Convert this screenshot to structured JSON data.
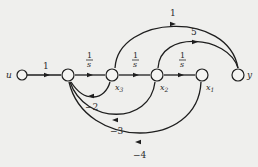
{
  "diagram": {
    "type": "signal-flow-graph",
    "colors": {
      "background": "#efefed",
      "line": "#1e1e1e",
      "node_fill": "#f4f4f2"
    },
    "nodes": [
      {
        "id": "u",
        "label": "u"
      },
      {
        "id": "n1",
        "label": ""
      },
      {
        "id": "x3",
        "label": "x3",
        "sub": "3"
      },
      {
        "id": "x2",
        "label": "x2",
        "sub": "2"
      },
      {
        "id": "x1",
        "label": "x1",
        "sub": "1"
      },
      {
        "id": "y",
        "label": "y"
      }
    ],
    "edges": [
      {
        "from": "u",
        "to": "n1",
        "gain": "1"
      },
      {
        "from": "n1",
        "to": "x3",
        "gain_num": "1",
        "gain_den": "s"
      },
      {
        "from": "x3",
        "to": "x2",
        "gain_num": "1",
        "gain_den": "s"
      },
      {
        "from": "x2",
        "to": "x1",
        "gain_num": "1",
        "gain_den": "s"
      },
      {
        "from": "x3",
        "to": "y",
        "gain": "1"
      },
      {
        "from": "x2",
        "to": "y",
        "gain": "5"
      },
      {
        "from": "x3",
        "to": "n1",
        "gain": "−2"
      },
      {
        "from": "x2",
        "to": "n1",
        "gain": "−3"
      },
      {
        "from": "x1",
        "to": "n1",
        "gain": "−4"
      }
    ]
  }
}
